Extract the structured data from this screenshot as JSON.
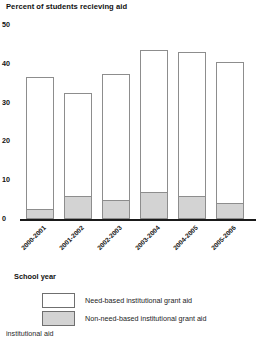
{
  "chart_data": {
    "type": "bar",
    "subtype": "stacked-bar",
    "title": "Percent of students recieving aid",
    "xlabel": "School year",
    "ylabel": "",
    "ylim": [
      0,
      50
    ],
    "yticks": [
      0,
      10,
      20,
      30,
      40,
      50
    ],
    "grid": false,
    "legend_position": "bottom",
    "categories": [
      "2000-2001",
      "2001-2002",
      "2002-2003",
      "2003-2004",
      "2004-2005",
      "2005-2006"
    ],
    "series": [
      {
        "name": "Non-need-based institutional grant aid",
        "color": "#d3d3d3",
        "values": [
          2.5,
          6.0,
          5.0,
          7.0,
          6.0,
          4.0
        ]
      },
      {
        "name": "Need-based institutional grant aid",
        "color": "#ffffff",
        "values": [
          34.0,
          26.5,
          32.5,
          36.5,
          37.0,
          36.5
        ]
      }
    ],
    "totals": [
      36.5,
      32.5,
      37.5,
      43.5,
      43.0,
      40.5
    ]
  },
  "legend": {
    "items": [
      {
        "label": "Need-based institutional grant aid",
        "swatch": "white"
      },
      {
        "label": "Non-need-based institutional grant aid",
        "swatch": "gray"
      }
    ]
  },
  "footer": {
    "clipped_text": "institutional aid"
  },
  "colors": {
    "bar_outline": "#8d8d8d",
    "axis": "#1a1a1a",
    "need_based": "#ffffff",
    "non_need_based": "#d3d3d3",
    "text": "#111111"
  }
}
